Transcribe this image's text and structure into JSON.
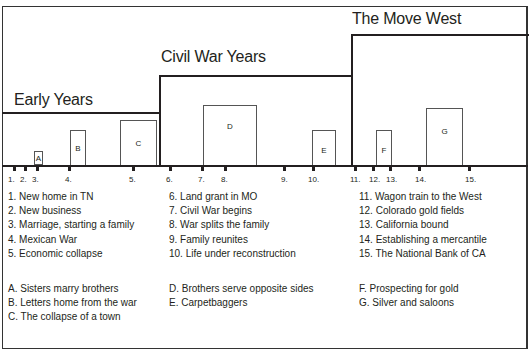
{
  "eras": [
    {
      "label": "Early Years",
      "x_start": 2,
      "x_end": 160,
      "top": 112,
      "label_x": 14,
      "label_y": 91
    },
    {
      "label": "Civil War Years",
      "x_start": 160,
      "x_end": 352,
      "top": 75,
      "label_x": 161,
      "label_y": 48
    },
    {
      "label": "The Move West",
      "x_start": 352,
      "x_end": 530,
      "top": 34,
      "label_x": 352,
      "label_y": 11
    }
  ],
  "event_boxes": [
    {
      "letter": "A",
      "x": 34,
      "y": 151,
      "w": 9,
      "h": 14
    },
    {
      "letter": "B",
      "x": 70,
      "y": 130,
      "w": 16,
      "h": 35
    },
    {
      "letter": "C",
      "x": 120,
      "y": 120,
      "w": 37,
      "h": 45
    },
    {
      "letter": "D",
      "x": 203,
      "y": 105,
      "w": 54,
      "h": 60
    },
    {
      "letter": "E",
      "x": 312,
      "y": 130,
      "w": 24,
      "h": 35
    },
    {
      "letter": "F",
      "x": 376,
      "y": 130,
      "w": 16,
      "h": 35
    },
    {
      "letter": "G",
      "x": 426,
      "y": 108,
      "w": 37,
      "h": 57
    }
  ],
  "ticks": [
    {
      "label": "1.",
      "x": 13
    },
    {
      "label": "2.",
      "x": 24
    },
    {
      "label": "3.",
      "x": 36
    },
    {
      "label": "4.",
      "x": 68
    },
    {
      "label": "5.",
      "x": 132
    },
    {
      "label": "6.",
      "x": 169
    },
    {
      "label": "7.",
      "x": 201
    },
    {
      "label": "8.",
      "x": 224
    },
    {
      "label": "9.",
      "x": 283
    },
    {
      "label": "10.",
      "x": 312
    },
    {
      "label": "11.",
      "x": 354
    },
    {
      "label": "12.",
      "x": 372
    },
    {
      "label": "13.",
      "x": 389
    },
    {
      "label": "14.",
      "x": 418
    },
    {
      "label": "15.",
      "x": 468
    }
  ],
  "legend": {
    "events": [
      [
        "1. New home in TN",
        "2. New business",
        "3. Marriage, starting a family",
        "4. Mexican War",
        "5. Economic collapse"
      ],
      [
        "6. Land grant in MO",
        "7. Civil War begins",
        "8. War splits the family",
        "9. Family reunites",
        "10. Life under reconstruction"
      ],
      [
        "11. Wagon train to the West",
        "12. Colorado gold fields",
        "13. California bound",
        "14. Establishing a mercantile",
        "15. The National Bank of CA"
      ]
    ],
    "stories": [
      [
        "A. Sisters marry brothers",
        "B. Letters home from the war",
        "C. The collapse of a town"
      ],
      [
        "D. Brothers serve opposite sides",
        "E. Carpetbaggers"
      ],
      [
        "F. Prospecting for gold",
        "G. Silver and saloons"
      ]
    ]
  }
}
